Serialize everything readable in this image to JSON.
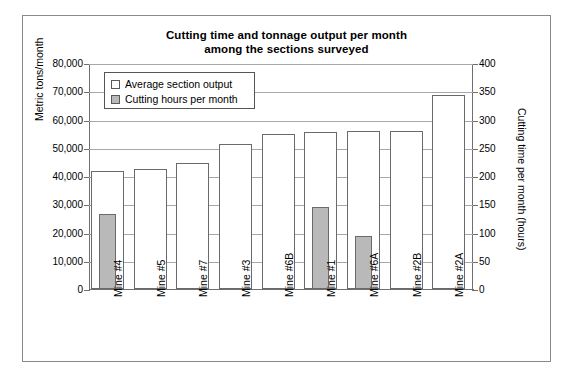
{
  "chart_data": {
    "type": "bar",
    "title": "Cutting time and tonnage output per month among the sections surveyed",
    "title_line1": "Cutting time and tonnage output per month",
    "title_line2": "among the sections surveyed",
    "xlabel": "",
    "ylabel": "Metric tons/month",
    "ylabel_secondary": "Cutting time per month (hours)",
    "categories": [
      "Mine #4",
      "Mine #5",
      "Mine #7",
      "Mine #3",
      "Mine #6B",
      "Mine #1",
      "Mine #6A",
      "Mine #2B",
      "Mine #2A"
    ],
    "series": [
      {
        "name": "Average section output",
        "axis": "left",
        "unit": "metric tons/month",
        "color": "#ffffff",
        "values": [
          41800,
          42600,
          44700,
          51200,
          54700,
          55500,
          56000,
          55800,
          68800
        ]
      },
      {
        "name": "Cutting hours per month",
        "axis": "right",
        "unit": "hours",
        "color": "#b9b9b9",
        "values": [
          133,
          null,
          null,
          null,
          null,
          145,
          94,
          null,
          null
        ]
      }
    ],
    "ylim": [
      0,
      80000
    ],
    "yticks": [
      0,
      10000,
      20000,
      30000,
      40000,
      50000,
      60000,
      70000,
      80000
    ],
    "ytick_labels": [
      "0",
      "10,000",
      "20,000",
      "30,000",
      "40,000",
      "50,000",
      "60,000",
      "70,000",
      "80,000"
    ],
    "ylim_secondary": [
      0,
      400
    ],
    "yticks_secondary": [
      0,
      50,
      100,
      150,
      200,
      250,
      300,
      350,
      400
    ],
    "ytick_labels_secondary": [
      "0",
      "50",
      "100",
      "150",
      "200",
      "250",
      "300",
      "350",
      "400"
    ],
    "grid": true,
    "grid_axis": "y",
    "legend_position": "upper-left-inside",
    "legend": [
      "Average section output",
      "Cutting hours per month"
    ]
  },
  "legend": {
    "items": [
      {
        "label": "Average section output",
        "swatch": "white-square-icon"
      },
      {
        "label": "Cutting hours per month",
        "swatch": "gray-square-icon"
      }
    ]
  },
  "colors": {
    "output_bar": "#ffffff",
    "hours_bar": "#b9b9b9",
    "bar_outline": "#6a6a6a",
    "gridline": "#a8a8a8",
    "axis": "#6f6f6f",
    "frame": "#8a8a8a",
    "text": "#000000"
  }
}
